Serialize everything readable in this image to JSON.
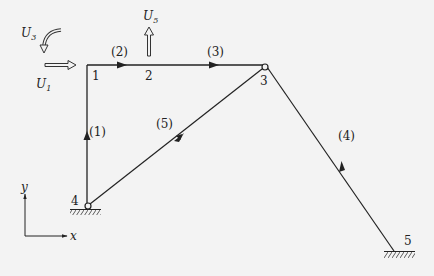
{
  "diagram": {
    "type": "frame-structure",
    "colors": {
      "background": "#f3f3f3",
      "line": "#222222"
    },
    "nodes": [
      {
        "id": "1",
        "label": "1",
        "x": 86,
        "y": 65
      },
      {
        "id": "2",
        "label": "2",
        "x": 149,
        "y": 65
      },
      {
        "id": "3",
        "label": "3",
        "x": 265,
        "y": 67
      },
      {
        "id": "4",
        "label": "4",
        "x": 88,
        "y": 206
      },
      {
        "id": "5",
        "label": "5",
        "x": 394,
        "y": 251
      }
    ],
    "elements": [
      {
        "label": "(1)",
        "from": "4",
        "to": "1"
      },
      {
        "label": "(2)",
        "from": "1",
        "to": "2"
      },
      {
        "label": "(3)",
        "from": "2",
        "to": "3"
      },
      {
        "label": "(4)",
        "from": "5",
        "to": "3"
      },
      {
        "label": "(5)",
        "from": "4",
        "to": "3"
      }
    ],
    "dofs": [
      {
        "symbol": "U",
        "subscript": "1",
        "description": "horizontal displacement at node 1"
      },
      {
        "symbol": "U",
        "subscript": "3",
        "description": "rotation at node 1"
      },
      {
        "symbol": "U",
        "subscript": "5",
        "description": "vertical displacement at node 2"
      }
    ],
    "axes": {
      "x_label": "x",
      "y_label": "y"
    }
  }
}
